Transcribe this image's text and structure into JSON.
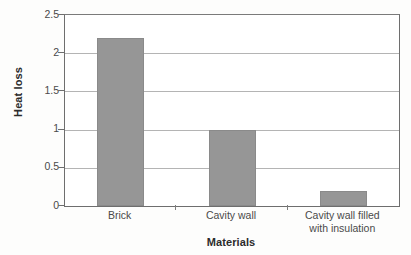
{
  "chart_data": {
    "type": "bar",
    "title": "",
    "xlabel": "Materials",
    "ylabel": "Heat loss",
    "categories": [
      "Brick",
      "Cavity wall",
      "Cavity wall filled with insulation"
    ],
    "category_lines": [
      [
        "Brick"
      ],
      [
        "Cavity wall"
      ],
      [
        "Cavity wall filled",
        "with insulation"
      ]
    ],
    "values": [
      2.2,
      1.0,
      0.2
    ],
    "ylim": [
      0,
      2.5
    ],
    "ytick_labels": [
      "0",
      "0.5",
      "1",
      "1.5",
      "2",
      "2.5"
    ],
    "ytick_values": [
      0,
      0.5,
      1,
      1.5,
      2,
      2.5
    ],
    "grid": "horizontal",
    "legend": "none",
    "bar_color": "#969696",
    "axis_color": "#6e6e6e",
    "grid_color": "#b4b4b4",
    "background_color": "#ffffff"
  }
}
